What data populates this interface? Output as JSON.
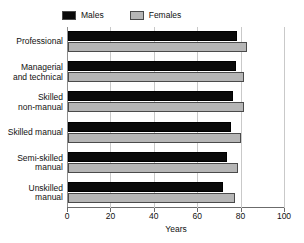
{
  "chart_data": {
    "type": "bar",
    "orientation": "horizontal",
    "title": "",
    "xlabel": "Years",
    "ylabel": "",
    "xlim": [
      0,
      100
    ],
    "xticks": [
      0,
      20,
      40,
      60,
      80,
      100
    ],
    "grid": true,
    "legend_position": "top-left",
    "categories": [
      "Professional",
      "Managerial and technical",
      "Skilled non-manual",
      "Skilled manual",
      "Semi-skilled manual",
      "Unskilled manual"
    ],
    "category_lines": [
      [
        "Professional"
      ],
      [
        "Managerial",
        "and technical"
      ],
      [
        "Skilled",
        "non-manual"
      ],
      [
        "Skilled manual"
      ],
      [
        "Semi-skilled",
        "manual"
      ],
      [
        "Unskilled",
        "manual"
      ]
    ],
    "series": [
      {
        "name": "Males",
        "color": "#0a0a0a",
        "values": [
          78.0,
          77.5,
          76.0,
          75.0,
          73.5,
          71.5
        ]
      },
      {
        "name": "Females",
        "color": "#b6b6b6",
        "values": [
          82.5,
          81.0,
          81.0,
          79.5,
          78.5,
          77.0
        ]
      }
    ]
  },
  "legend": {
    "entries": [
      {
        "label": "Males",
        "swatch": "males-swatch"
      },
      {
        "label": "Females",
        "swatch": "females-swatch"
      }
    ]
  },
  "axis": {
    "x_title": "Years",
    "tick_labels": [
      "0",
      "20",
      "40",
      "60",
      "80",
      "100"
    ]
  }
}
